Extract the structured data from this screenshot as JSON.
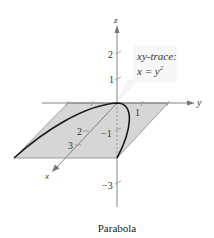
{
  "figure": {
    "caption": "Parabola",
    "callout": {
      "line1": "xy-trace:",
      "line2_lhs": "x = y",
      "line2_exp": "2"
    },
    "axes": {
      "x_label": "x",
      "y_label": "y",
      "z_label": "z"
    },
    "ticks": {
      "z_pos_2": "2",
      "z_pos_1": "1",
      "z_neg_1": "−1",
      "z_neg_3": "−3",
      "x_2": "2",
      "x_3": "3",
      "y_1": "1"
    },
    "colors": {
      "plane_fill": "#d6d6d6",
      "axis": "#777777",
      "curve": "#1a1a1a",
      "callout_bg": "#f7f7f7"
    },
    "curve_equation": "x = y^2"
  }
}
